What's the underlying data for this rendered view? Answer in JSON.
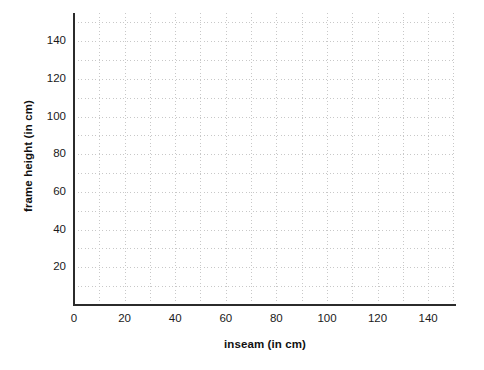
{
  "chart_data": {
    "type": "scatter",
    "title": "",
    "xlabel": "inseam (in cm)",
    "ylabel": "frame height (in cm)",
    "xlim": [
      0,
      151
    ],
    "ylim": [
      0,
      155
    ],
    "xticks": [
      0,
      20,
      40,
      60,
      80,
      100,
      120,
      140
    ],
    "yticks": [
      20,
      40,
      60,
      80,
      100,
      120,
      140
    ],
    "xtick_labels": [
      "0",
      "20",
      "40",
      "60",
      "80",
      "100",
      "120",
      "140"
    ],
    "ytick_labels": [
      "20",
      "40",
      "60",
      "80",
      "100",
      "120",
      "140"
    ],
    "grid": true,
    "grid_style": "dotted",
    "grid_color": "#c8c8c8",
    "grid_minor_step_x": 10,
    "grid_minor_step_y": 10,
    "legend": null,
    "series": [
      {
        "name": "data",
        "x": [],
        "y": []
      }
    ],
    "annotations": [],
    "background_color": "#ffffff",
    "axis_color": "#2b2b2b",
    "text_color": "#1a1a1a"
  },
  "axes": {
    "x_title": "inseam (in cm)",
    "y_title": "frame height (in cm)"
  }
}
